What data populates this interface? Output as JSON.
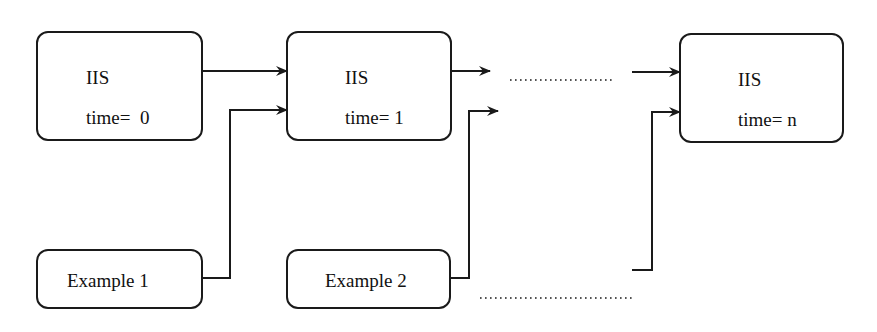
{
  "diagram": {
    "type": "flow",
    "nodes": [
      {
        "id": "iis0",
        "title": "IIS",
        "subtitle": "time=  0"
      },
      {
        "id": "iis1",
        "title": "IIS",
        "subtitle": "time= 1"
      },
      {
        "id": "iisn",
        "title": "IIS",
        "subtitle": "time= n"
      },
      {
        "id": "ex1",
        "title": "Example 1"
      },
      {
        "id": "ex2",
        "title": "Example 2"
      }
    ],
    "ellipsis_top": "...................",
    "ellipsis_bottom": "................................",
    "edges": [
      {
        "from": "iis0",
        "to": "iis1"
      },
      {
        "from": "ex1",
        "to": "iis1"
      },
      {
        "from": "iis1",
        "to": "ellipsis"
      },
      {
        "from": "ex2",
        "to": "ellipsis"
      },
      {
        "from": "ellipsis",
        "to": "iisn"
      },
      {
        "from": "ellipsis",
        "to": "iisn"
      }
    ],
    "colors": {
      "stroke": "#1a1a1a",
      "background": "#ffffff"
    }
  }
}
